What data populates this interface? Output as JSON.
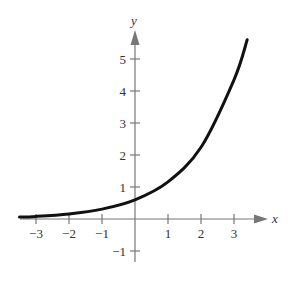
{
  "chart_data": {
    "type": "line",
    "title": "",
    "xlabel": "x",
    "ylabel": "y",
    "xlim": [
      -3.5,
      3.9
    ],
    "ylim": [
      -1.5,
      5.8
    ],
    "grid": false,
    "legend": null,
    "x_ticks": [
      -3,
      -2,
      -1,
      1,
      2,
      3
    ],
    "x_tick_labels": [
      "−3",
      "−2",
      "−1",
      "1",
      "2",
      "3"
    ],
    "y_ticks": [
      -1,
      1,
      2,
      3,
      4,
      5
    ],
    "y_tick_labels": [
      "−1",
      "1",
      "2",
      "3",
      "4",
      "5"
    ],
    "series": [
      {
        "name": "exponential curve",
        "description": "increasing exponential, approx y = 0.6 e^(0.66x)",
        "x": [
          -3.5,
          -3,
          -2,
          -1,
          0,
          1,
          2,
          3,
          3.4
        ],
        "y": [
          0.06,
          0.08,
          0.16,
          0.31,
          0.6,
          1.16,
          2.24,
          4.35,
          5.6
        ]
      }
    ]
  }
}
